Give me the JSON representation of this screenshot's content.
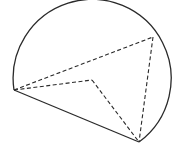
{
  "diagram": {
    "type": "geometry-figure",
    "colors": {
      "stroke": "#2a2a2a",
      "background": "#ffffff"
    },
    "points": {
      "A": {
        "x": 14,
        "y": 90
      },
      "B": {
        "x": 139,
        "y": 142
      },
      "C": {
        "x": 153,
        "y": 37
      },
      "D": {
        "x": 92,
        "y": 80
      }
    },
    "arc": {
      "center": {
        "x": 92,
        "y": 87
      },
      "radius": 79,
      "from": "A",
      "to": "B",
      "sweep": "over-top"
    },
    "solid_segments": [
      [
        "A",
        "B"
      ]
    ],
    "dashed_segments": [
      [
        "A",
        "C"
      ],
      [
        "A",
        "D"
      ],
      [
        "D",
        "B"
      ],
      [
        "C",
        "B"
      ]
    ]
  }
}
